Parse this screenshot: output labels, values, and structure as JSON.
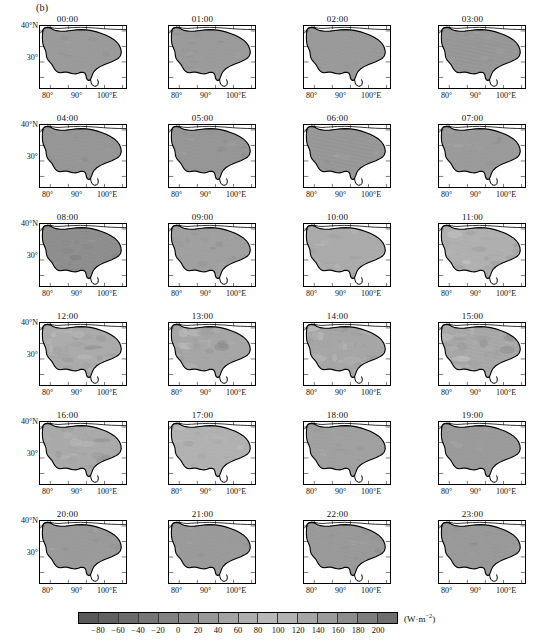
{
  "figure": {
    "panel_label": "(b)",
    "axis": {
      "ylabels": [
        "40°N",
        "30°"
      ],
      "xlabels": [
        "80°",
        "90°",
        "100°E"
      ]
    }
  },
  "chart_data": {
    "type": "heatmap",
    "title": "(b)",
    "subtitle": "Diurnal cycle of surface net radiation over the Tibetan Plateau",
    "xlabel": "",
    "ylabel": "",
    "grid": false,
    "legend_position": "bottom",
    "map_region": "Tibetan Plateau",
    "xlim": [
      73,
      106
    ],
    "ylim": [
      25.5,
      41
    ],
    "x_ticks": [
      80,
      90,
      100
    ],
    "x_tick_labels": [
      "80°",
      "90°",
      "100°E"
    ],
    "y_ticks": [
      40,
      30
    ],
    "y_tick_labels": [
      "40°N",
      "30°"
    ],
    "colorbar": {
      "units": "(W·m⁻²)",
      "unit_plain": "W m-2",
      "vmin": -100,
      "vmax": 220,
      "tick_values": [
        -80,
        -60,
        -40,
        -20,
        0,
        20,
        40,
        60,
        80,
        100,
        120,
        140,
        160,
        180,
        200
      ],
      "tick_labels": [
        "−80",
        "−60",
        "−40",
        "−20",
        "0",
        "20",
        "40",
        "60",
        "80",
        "100",
        "120",
        "140",
        "160",
        "180",
        "200"
      ],
      "n_segments": 16,
      "colormap": "grayscale",
      "segment_colors": [
        "#595959",
        "#616161",
        "#6b6b6b",
        "#767676",
        "#828282",
        "#8d8d8d",
        "#989898",
        "#a3a3a3",
        "#aeaeae",
        "#b8b8b8",
        "#b2b2b2",
        "#a6a6a6",
        "#9a9a9a",
        "#8c8c8c",
        "#7d7d7d",
        "#6e6e6e"
      ]
    },
    "panels": [
      {
        "time": "00:00",
        "row": 0,
        "col": 0,
        "mean_value": -55,
        "fill": "#9b9b9b",
        "texture": 0.05
      },
      {
        "time": "01:00",
        "row": 0,
        "col": 1,
        "mean_value": -56,
        "fill": "#9c9c9c",
        "texture": 0.05
      },
      {
        "time": "02:00",
        "row": 0,
        "col": 2,
        "mean_value": -57,
        "fill": "#9a9a9a",
        "texture": 0.05
      },
      {
        "time": "03:00",
        "row": 0,
        "col": 3,
        "mean_value": -58,
        "fill": "#999999",
        "texture": 0.05
      },
      {
        "time": "04:00",
        "row": 1,
        "col": 0,
        "mean_value": -59,
        "fill": "#989898",
        "texture": 0.06
      },
      {
        "time": "05:00",
        "row": 1,
        "col": 1,
        "mean_value": -60,
        "fill": "#979797",
        "texture": 0.06
      },
      {
        "time": "06:00",
        "row": 1,
        "col": 2,
        "mean_value": -58,
        "fill": "#999999",
        "texture": 0.06
      },
      {
        "time": "07:00",
        "row": 1,
        "col": 3,
        "mean_value": -45,
        "fill": "#9d9d9d",
        "texture": 0.07
      },
      {
        "time": "08:00",
        "row": 2,
        "col": 0,
        "mean_value": -20,
        "fill": "#8f8f8f",
        "texture": 0.12
      },
      {
        "time": "09:00",
        "row": 2,
        "col": 1,
        "mean_value": 20,
        "fill": "#a0a0a0",
        "texture": 0.12
      },
      {
        "time": "10:00",
        "row": 2,
        "col": 2,
        "mean_value": 70,
        "fill": "#ababab",
        "texture": 0.12
      },
      {
        "time": "11:00",
        "row": 2,
        "col": 3,
        "mean_value": 110,
        "fill": "#b0b0b0",
        "texture": 0.2
      },
      {
        "time": "12:00",
        "row": 3,
        "col": 0,
        "mean_value": 140,
        "fill": "#ababab",
        "texture": 0.28
      },
      {
        "time": "13:00",
        "row": 3,
        "col": 1,
        "mean_value": 155,
        "fill": "#a7a7a7",
        "texture": 0.3
      },
      {
        "time": "14:00",
        "row": 3,
        "col": 2,
        "mean_value": 150,
        "fill": "#a8a8a8",
        "texture": 0.3
      },
      {
        "time": "15:00",
        "row": 3,
        "col": 3,
        "mean_value": 135,
        "fill": "#a9a9a9",
        "texture": 0.3
      },
      {
        "time": "16:00",
        "row": 4,
        "col": 0,
        "mean_value": 100,
        "fill": "#aaaaaa",
        "texture": 0.22
      },
      {
        "time": "17:00",
        "row": 4,
        "col": 1,
        "mean_value": 55,
        "fill": "#b1b1b1",
        "texture": 0.12
      },
      {
        "time": "18:00",
        "row": 4,
        "col": 2,
        "mean_value": 5,
        "fill": "#a1a1a1",
        "texture": 0.07
      },
      {
        "time": "19:00",
        "row": 4,
        "col": 3,
        "mean_value": -35,
        "fill": "#9d9d9d",
        "texture": 0.05
      },
      {
        "time": "20:00",
        "row": 5,
        "col": 0,
        "mean_value": -48,
        "fill": "#9b9b9b",
        "texture": 0.05
      },
      {
        "time": "21:00",
        "row": 5,
        "col": 1,
        "mean_value": -50,
        "fill": "#9b9b9b",
        "texture": 0.05
      },
      {
        "time": "22:00",
        "row": 5,
        "col": 2,
        "mean_value": -52,
        "fill": "#9a9a9a",
        "texture": 0.05
      },
      {
        "time": "23:00",
        "row": 5,
        "col": 3,
        "mean_value": -54,
        "fill": "#9a9a9a",
        "texture": 0.05
      }
    ]
  }
}
